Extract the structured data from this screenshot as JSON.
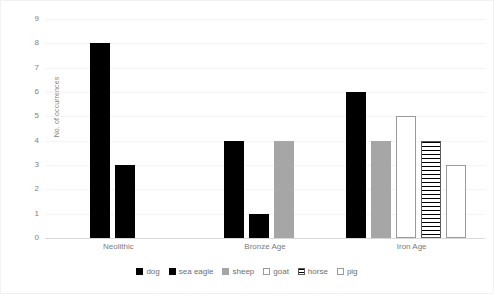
{
  "chart_data": {
    "type": "bar",
    "title": "",
    "xlabel": "",
    "ylabel": "No. of occurrences",
    "ylim": [
      0,
      9
    ],
    "yticks": [
      0,
      1,
      2,
      3,
      4,
      5,
      6,
      7,
      8,
      9
    ],
    "grid": true,
    "legend_position": "bottom",
    "categories": [
      "Neolithic",
      "Bronze Age",
      "Iron Age"
    ],
    "series": [
      {
        "name": "dog",
        "style": "black",
        "values": [
          8,
          4,
          6
        ]
      },
      {
        "name": "sea eagle",
        "style": "black",
        "values": [
          3,
          1,
          null
        ]
      },
      {
        "name": "sheep",
        "style": "gray",
        "values": [
          null,
          4,
          4
        ]
      },
      {
        "name": "goat",
        "style": "white",
        "values": [
          null,
          null,
          5
        ]
      },
      {
        "name": "horse",
        "style": "hatch",
        "values": [
          null,
          null,
          4
        ]
      },
      {
        "name": "pig",
        "style": "white",
        "values": [
          null,
          null,
          3
        ]
      }
    ]
  },
  "legend": {
    "items": [
      {
        "label": "dog",
        "style": "black"
      },
      {
        "label": "sea eagle",
        "style": "black"
      },
      {
        "label": "sheep",
        "style": "gray"
      },
      {
        "label": "goat",
        "style": "white"
      },
      {
        "label": "horse",
        "style": "hatch"
      },
      {
        "label": "pig",
        "style": "white"
      }
    ]
  },
  "colors": {
    "black": "#000000",
    "gray": "#a6a6a6",
    "white": "#ffffff",
    "outline": "#9a9a9a",
    "gridline": "#f4f4f4",
    "axis": "#d9d9d9",
    "tick_text": "#808080",
    "label_text": "#7b7b7b"
  }
}
